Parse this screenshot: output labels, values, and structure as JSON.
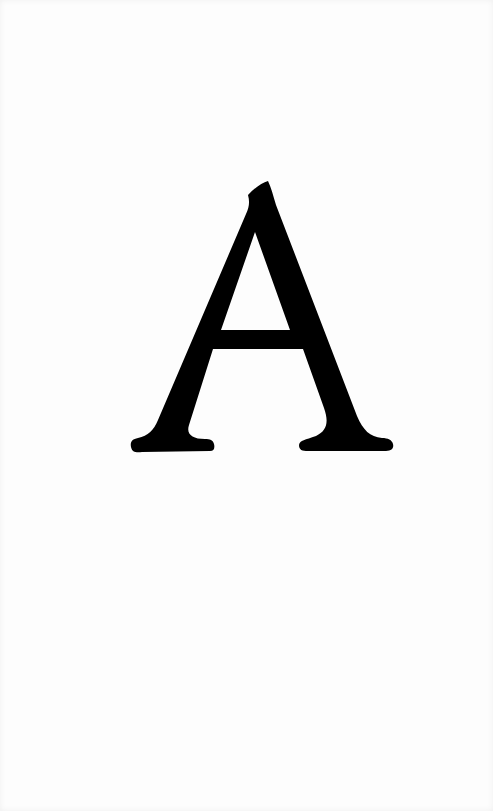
{
  "page": {
    "background": "#fdfdfd"
  },
  "glyph": {
    "character": "A",
    "color": "#000000",
    "style": "serif capital letter"
  }
}
